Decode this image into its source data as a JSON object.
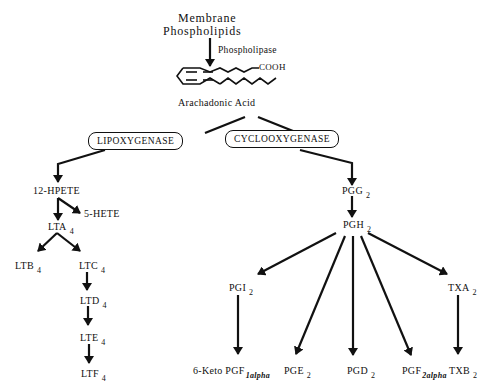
{
  "diagram": {
    "top": {
      "line1": "Membrane",
      "line2": "Phospholipids",
      "enzyme": "Phospholipase",
      "cooh": "COOH",
      "acid": "Arachadonic Acid"
    },
    "enzymes": {
      "lipoxygenase": "LIPOXYGENASE",
      "cyclooxygenase": "CYCLOOXYGENASE"
    },
    "lipoxygenase_path": {
      "hpete": "12-HPETE",
      "hete": "5-HETE",
      "lta": {
        "base": "LTA",
        "sub": "4"
      },
      "ltb": {
        "base": "LTB",
        "sub": "4"
      },
      "ltc": {
        "base": "LTC",
        "sub": "4"
      },
      "ltd": {
        "base": "LTD",
        "sub": "4"
      },
      "lte": {
        "base": "LTE",
        "sub": "4"
      },
      "ltf": {
        "base": "LTF",
        "sub": "4"
      }
    },
    "cyclooxygenase_path": {
      "pgg": {
        "base": "PGG",
        "sub": "2"
      },
      "pgh": {
        "base": "PGH",
        "sub": "2"
      },
      "pgi": {
        "base": "PGI",
        "sub": "2"
      },
      "txa": {
        "base": "TXA",
        "sub": "2"
      },
      "keto": {
        "base": "6-Keto PGF",
        "sub": "1alpha"
      },
      "pge": {
        "base": "PGE",
        "sub": "2"
      },
      "pgd": {
        "base": "PGD",
        "sub": "2"
      },
      "pgf": {
        "base": "PGF",
        "sub": "2alpha"
      },
      "txb": {
        "base": "TXB",
        "sub": "2"
      }
    }
  }
}
